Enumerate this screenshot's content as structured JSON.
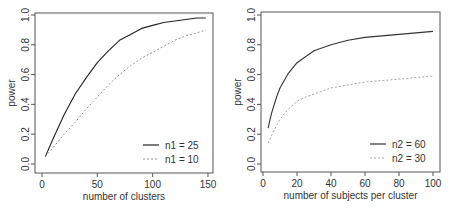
{
  "chart_data": [
    {
      "type": "line",
      "title": "",
      "xlabel": "number of clusters",
      "ylabel": "power",
      "xlim": [
        0,
        150
      ],
      "ylim": [
        0,
        1
      ],
      "xticks": [
        0,
        50,
        100,
        150
      ],
      "yticks": [
        0.0,
        0.2,
        0.4,
        0.6,
        0.8,
        1.0
      ],
      "ytick_labels": [
        "0.0",
        "0.2",
        "0.4",
        "0.6",
        "0.8",
        "1.0"
      ],
      "xtick_labels": [
        "0",
        "50",
        "100",
        "150"
      ],
      "grid": false,
      "legend_position": "bottom-right",
      "x": [
        3,
        10,
        20,
        30,
        40,
        50,
        60,
        70,
        80,
        90,
        100,
        110,
        120,
        130,
        140,
        148
      ],
      "series": [
        {
          "name": "n1 = 25",
          "style": "solid",
          "color": "#222222",
          "values": [
            0.05,
            0.17,
            0.33,
            0.47,
            0.58,
            0.68,
            0.76,
            0.83,
            0.87,
            0.91,
            0.93,
            0.95,
            0.96,
            0.97,
            0.98,
            0.98
          ]
        },
        {
          "name": "n1 = 10",
          "style": "dashed",
          "color": "#888888",
          "values": [
            0.05,
            0.11,
            0.2,
            0.28,
            0.37,
            0.45,
            0.53,
            0.6,
            0.66,
            0.71,
            0.75,
            0.79,
            0.83,
            0.86,
            0.88,
            0.9
          ]
        }
      ]
    },
    {
      "type": "line",
      "title": "",
      "xlabel": "number of subjects per cluster",
      "ylabel": "power",
      "xlim": [
        0,
        100
      ],
      "ylim": [
        0,
        1
      ],
      "xticks": [
        0,
        20,
        40,
        60,
        80,
        100
      ],
      "yticks": [
        0.0,
        0.2,
        0.4,
        0.6,
        0.8,
        1.0
      ],
      "ytick_labels": [
        "0.0",
        "0.2",
        "0.4",
        "0.6",
        "0.8",
        "1.0"
      ],
      "xtick_labels": [
        "0",
        "20",
        "40",
        "60",
        "80",
        "100"
      ],
      "grid": false,
      "legend_position": "bottom-right",
      "x": [
        3,
        5,
        8,
        10,
        15,
        20,
        25,
        30,
        40,
        50,
        60,
        70,
        80,
        90,
        100
      ],
      "series": [
        {
          "name": "n2 = 60",
          "style": "solid",
          "color": "#333333",
          "values": [
            0.24,
            0.34,
            0.45,
            0.51,
            0.61,
            0.68,
            0.72,
            0.76,
            0.8,
            0.83,
            0.85,
            0.86,
            0.87,
            0.88,
            0.89
          ]
        },
        {
          "name": "n2 = 30",
          "style": "dashed",
          "color": "#999999",
          "values": [
            0.14,
            0.19,
            0.26,
            0.3,
            0.37,
            0.42,
            0.45,
            0.47,
            0.51,
            0.53,
            0.55,
            0.56,
            0.57,
            0.58,
            0.59
          ]
        }
      ]
    }
  ]
}
